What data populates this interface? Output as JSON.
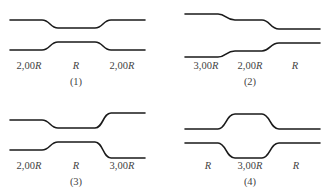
{
  "panels": [
    {
      "id": "(1)",
      "segments": [
        {
          "label_num": "2,00",
          "label_var": "R"
        },
        {
          "label_num": "",
          "label_var": "R"
        },
        {
          "label_num": "2,00",
          "label_var": "R"
        }
      ]
    },
    {
      "id": "(2)",
      "segments": [
        {
          "label_num": "3,00",
          "label_var": "R"
        },
        {
          "label_num": "2,00",
          "label_var": "R"
        },
        {
          "label_num": "",
          "label_var": "R"
        }
      ]
    },
    {
      "id": "(3)",
      "segments": [
        {
          "label_num": "2,00",
          "label_var": "R"
        },
        {
          "label_num": "",
          "label_var": "R"
        },
        {
          "label_num": "3,00",
          "label_var": "R"
        }
      ]
    },
    {
      "id": "(4)",
      "segments": [
        {
          "label_num": "",
          "label_var": "R"
        },
        {
          "label_num": "3,00",
          "label_var": "R"
        },
        {
          "label_num": "",
          "label_var": "R"
        }
      ]
    }
  ],
  "colors": {
    "line": "#1a1a1a",
    "text": "#444444",
    "background": "#ffffff"
  }
}
